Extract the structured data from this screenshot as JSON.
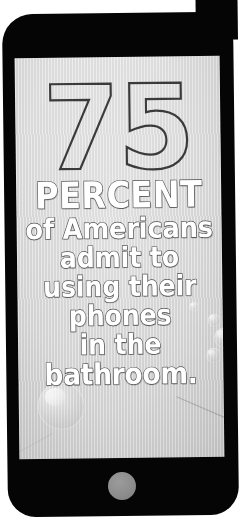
{
  "poster": {
    "type": "infographic-statistic-card",
    "device": "smartphone",
    "background_color": "#ffffff",
    "frame_color": "#050505",
    "screen_color": "#dcdcdc"
  },
  "statistic": {
    "number": "75",
    "number_style": "outlined",
    "unit_label": "PERCENT",
    "body_lines": [
      "of Americans",
      "admit to",
      "using their",
      "phones",
      "in the",
      "bathroom."
    ],
    "full_sentence": "75 PERCENT of Americans admit to using their phones in the bathroom.",
    "text_color": "#ffffff",
    "outline_color": "#4a4a4a"
  },
  "decorations": {
    "bubbles_label": "soap-bubble",
    "bubble_count": 6,
    "scratches_label": "scan-scratch"
  },
  "device_parts": {
    "home_button_label": "home-button",
    "home_button_color": "#8d8d8d",
    "screen_label": "phone-screen",
    "body_label": "phone-body"
  }
}
